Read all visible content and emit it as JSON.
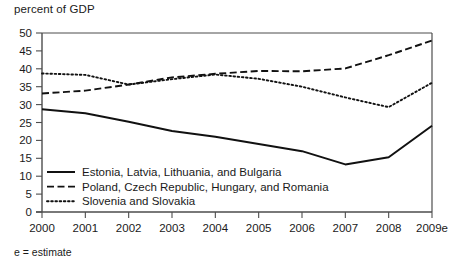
{
  "chart_data": {
    "type": "line",
    "title": "",
    "ylabel": "percent of GDP",
    "xlabel": "",
    "footnote": "e = estimate",
    "grid": false,
    "legend_position": "inside-bottom-left",
    "ylim": [
      0,
      50
    ],
    "yticks": [
      0,
      5,
      10,
      15,
      20,
      25,
      30,
      35,
      40,
      45,
      50
    ],
    "ytick_labels": [
      "0",
      "5",
      "10",
      "15",
      "20",
      "25",
      "30",
      "35",
      "40",
      "45",
      "50"
    ],
    "x": [
      "2000",
      "2001",
      "2002",
      "2003",
      "2004",
      "2005",
      "2006",
      "2007",
      "2008",
      "2009e"
    ],
    "xtick_labels": [
      "2000",
      "2001",
      "2002",
      "2003",
      "2004",
      "2005",
      "2006",
      "2007",
      "2008",
      "2009e"
    ],
    "series": [
      {
        "name": "Estonia, Latvia, Lithuania, and Bulgaria",
        "style": "solid",
        "color": "#111111",
        "values": [
          28.7,
          27.6,
          25.2,
          22.6,
          21.0,
          19.0,
          17.0,
          13.3,
          15.3,
          24.1
        ]
      },
      {
        "name": "Poland, Czech Republic, Hungary, and Romania",
        "style": "dashed",
        "color": "#111111",
        "values": [
          33.1,
          33.9,
          35.6,
          37.6,
          38.6,
          39.4,
          39.3,
          40.1,
          43.8,
          47.9
        ]
      },
      {
        "name": "Slovenia and Slovakia",
        "style": "dotted",
        "color": "#111111",
        "values": [
          38.7,
          38.3,
          35.6,
          37.1,
          38.4,
          37.2,
          35.0,
          32.0,
          29.3,
          36.1
        ]
      }
    ]
  },
  "legend": {
    "items": [
      {
        "label": "Estonia, Latvia, Lithuania, and Bulgaria",
        "style": "solid"
      },
      {
        "label": "Poland, Czech Republic, Hungary, and Romania",
        "style": "dashed"
      },
      {
        "label": "Slovenia and Slovakia",
        "style": "dotted"
      }
    ]
  }
}
